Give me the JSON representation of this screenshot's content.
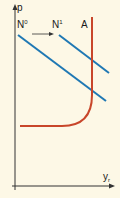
{
  "diagram": {
    "axes": {
      "y_label": "p",
      "x_label_main": "y",
      "x_label_sub": "r"
    },
    "curves": {
      "n0": {
        "label_main": "N",
        "label_sup": "0",
        "color": "#1f78b4"
      },
      "n1": {
        "label_main": "N",
        "label_sup": "1",
        "color": "#1f78b4"
      },
      "a": {
        "label": "A",
        "color": "#c8462a"
      }
    },
    "shift_arrow": {
      "from": "N0",
      "to": "N1",
      "direction": "right"
    },
    "colors": {
      "background": "#fdf8e6",
      "axis": "#333333"
    }
  }
}
